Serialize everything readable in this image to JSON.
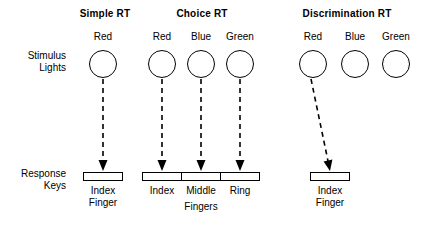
{
  "figure": {
    "row_labels": {
      "stimulus": [
        "Stimulus",
        "Lights"
      ],
      "response": [
        "Response",
        "Keys"
      ]
    },
    "bottom_label": "Fingers",
    "colors": {
      "ink": "#000000",
      "background": "#ffffff"
    },
    "panels": [
      {
        "id": "simple-rt",
        "title": "Simple RT",
        "lights": [
          {
            "label": "Red",
            "connected": true
          }
        ],
        "keys": [
          {
            "lines": [
              "Index",
              "Finger"
            ]
          }
        ]
      },
      {
        "id": "choice-rt",
        "title": "Choice RT",
        "lights": [
          {
            "label": "Red",
            "connected": true
          },
          {
            "label": "Blue",
            "connected": true
          },
          {
            "label": "Green",
            "connected": true
          }
        ],
        "keys": [
          {
            "lines": [
              "Index"
            ]
          },
          {
            "lines": [
              "Middle"
            ]
          },
          {
            "lines": [
              "Ring"
            ]
          }
        ]
      },
      {
        "id": "discrimination-rt",
        "title": "Discrimination RT",
        "lights": [
          {
            "label": "Red",
            "connected": true
          },
          {
            "label": "Blue",
            "connected": false
          },
          {
            "label": "Green",
            "connected": false
          }
        ],
        "keys": [
          {
            "lines": [
              "Index",
              "Finger"
            ]
          }
        ]
      }
    ]
  }
}
